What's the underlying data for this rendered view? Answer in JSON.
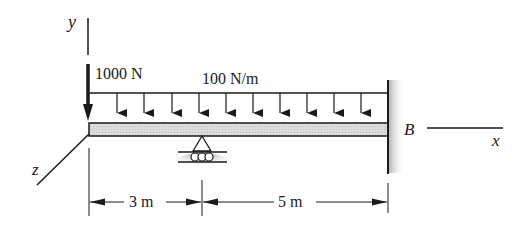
{
  "figure": {
    "type": "beam-loading-diagram",
    "axes": {
      "y_label": "y",
      "x_label": "x",
      "z_label": "z"
    },
    "point_load": {
      "label": "1000 N"
    },
    "distributed_load": {
      "label": "100 N/m",
      "arrow_count": 12
    },
    "fixed_end": {
      "label": "B"
    },
    "support": {
      "type": "roller"
    },
    "dimensions": [
      {
        "label": "3 m"
      },
      {
        "label": "5 m"
      }
    ]
  },
  "colors": {
    "ink": "#1a1a1a",
    "beam_fill": "#d9d9d9",
    "shadow": "#8c8c8c"
  }
}
